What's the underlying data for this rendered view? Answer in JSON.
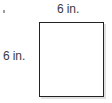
{
  "figure": {
    "kind": "geometry-diagram",
    "shape": "square",
    "labels": {
      "top": "6 in.",
      "left": "6 in."
    },
    "artifact": {
      "mark": "."
    },
    "colors": {
      "stroke": "#222222",
      "fill": "#ffffff",
      "text": "#3b3b3b",
      "shadow": "#c9c9c9",
      "background": "#ffffff"
    }
  },
  "chart_data": {
    "type": "diagram",
    "title": "",
    "shape": "square",
    "dimensions": [
      {
        "side": "top",
        "value": 6,
        "unit": "in.",
        "label": "6 in."
      },
      {
        "side": "left",
        "value": 6,
        "unit": "in.",
        "label": "6 in."
      }
    ]
  }
}
